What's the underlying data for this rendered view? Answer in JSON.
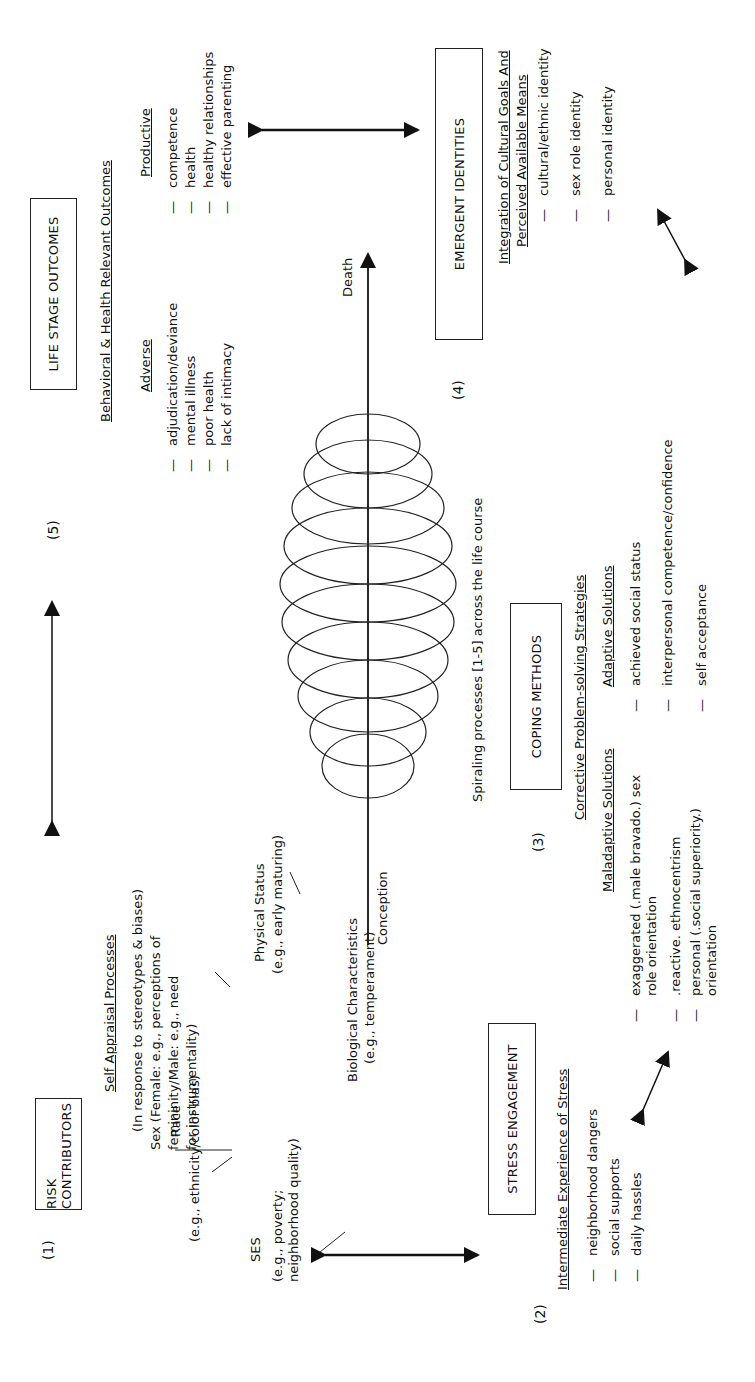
{
  "nodes": {
    "risk": {
      "number": "(1)",
      "title": "RISK CONTRIBUTORS",
      "self_appraisal": {
        "heading": "Self Appraisal Processes",
        "subheading": "(In response to stereotypes & biases)"
      },
      "items": {
        "race": {
          "label": "Race",
          "detail": "(e.g., ethnicity/color bias)"
        },
        "ses": {
          "label": "SES",
          "detail_line1": "(e.g., poverty;",
          "detail_line2": "neighborhood quality)"
        },
        "biological": {
          "label": "Biological Characteristics",
          "detail": "(e.g., temperament)"
        },
        "physical": {
          "label": "Physical Status",
          "detail": "(e.g., early maturing)"
        },
        "sex": {
          "line1": "Sex (Female: e.g., perceptions of",
          "line2": "femininity/Male: e.g., need",
          "line3": "for instrumentality)"
        }
      }
    },
    "stress": {
      "number": "(2)",
      "title": "STRESS ENGAGEMENT",
      "heading": "Intermediate Experience of Stress",
      "items": [
        "neighborhood dangers",
        "social supports",
        "daily hassles"
      ]
    },
    "coping": {
      "number": "(3)",
      "title": "COPING METHODS",
      "heading": "Corrective Problem-solving Strategies",
      "maladaptive": {
        "heading": "Maladaptive Solutions",
        "items": [
          {
            "line1": "exaggerated (.male bravado.) sex",
            "line2": "role orientation"
          },
          {
            "line1": ".reactive. ethnocentrism",
            "line2": ""
          },
          {
            "line1": "personal (.social superiority.)",
            "line2": "orientation"
          }
        ]
      },
      "adaptive": {
        "heading": "Adaptive Solutions",
        "items": [
          "achieved social status",
          "interpersonal competence/confidence",
          "self acceptance"
        ]
      }
    },
    "identities": {
      "number": "(4)",
      "title": "EMERGENT IDENTITIES",
      "heading_line1": "Integration of Cultural Goals And",
      "heading_line2": "Perceived Available Means",
      "items": [
        "cultural/ethnic identity",
        "sex role identity",
        "personal identity"
      ]
    },
    "outcomes": {
      "number": "(5)",
      "title": "LIFE STAGE OUTCOMES",
      "heading": "Behavioral & Health Relevant Outcomes",
      "adverse": {
        "heading": "Adverse",
        "items": [
          "adjudication/deviance",
          "mental illness",
          "poor health",
          "lack of intimacy"
        ]
      },
      "productive": {
        "heading": "Productive",
        "items": [
          "competence",
          "health",
          "healthy relationships",
          "effective parenting"
        ]
      }
    }
  },
  "spiral": {
    "start_label": "Conception",
    "end_label": "Death",
    "caption": "Spiraling processes [1-5] across the life course"
  },
  "bullet": "—"
}
